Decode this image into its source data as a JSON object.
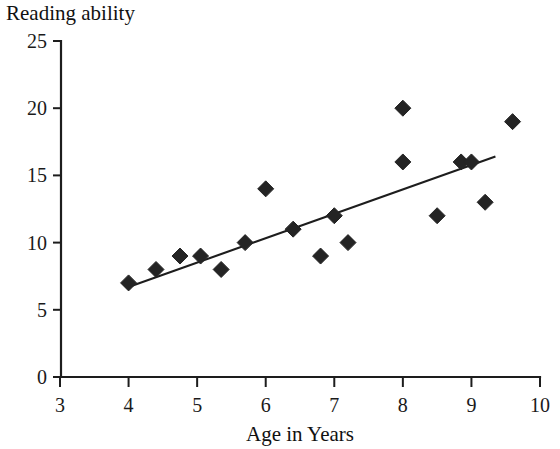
{
  "chart_data": {
    "type": "scatter",
    "title": "Reading ability",
    "subtitle": "",
    "xlabel": "Age in Years",
    "ylabel": "",
    "xlim": [
      3,
      10
    ],
    "ylim": [
      0,
      25
    ],
    "xticks": [
      3,
      4,
      5,
      6,
      7,
      8,
      9,
      10
    ],
    "xtick_labels": [
      "3",
      "4",
      "5",
      "6",
      "7",
      "8",
      "9",
      "10"
    ],
    "yticks": [
      0,
      5,
      10,
      15,
      20,
      25
    ],
    "ytick_labels": [
      "0",
      "5",
      "10",
      "15",
      "20",
      "25"
    ],
    "grid": false,
    "legend": false,
    "marker_shape": "diamond",
    "marker_color": "#242424",
    "line_color": "#1d1d1d",
    "axis_color": "#1d1d1d",
    "series": [
      {
        "name": "Reading ability by age",
        "points": [
          {
            "x": 4.0,
            "y": 7
          },
          {
            "x": 4.4,
            "y": 8
          },
          {
            "x": 4.75,
            "y": 9
          },
          {
            "x": 5.05,
            "y": 9
          },
          {
            "x": 5.35,
            "y": 8
          },
          {
            "x": 5.7,
            "y": 10
          },
          {
            "x": 6.0,
            "y": 14
          },
          {
            "x": 6.4,
            "y": 11
          },
          {
            "x": 6.8,
            "y": 9
          },
          {
            "x": 7.0,
            "y": 12
          },
          {
            "x": 7.2,
            "y": 10
          },
          {
            "x": 8.0,
            "y": 20
          },
          {
            "x": 8.0,
            "y": 16
          },
          {
            "x": 8.5,
            "y": 12
          },
          {
            "x": 8.85,
            "y": 16
          },
          {
            "x": 9.0,
            "y": 16
          },
          {
            "x": 9.2,
            "y": 13
          },
          {
            "x": 9.6,
            "y": 19
          }
        ]
      }
    ],
    "trendline": {
      "name": "linear-fit",
      "x_start": 4.0,
      "y_start": 6.7,
      "x_end": 9.35,
      "y_end": 16.4
    }
  }
}
